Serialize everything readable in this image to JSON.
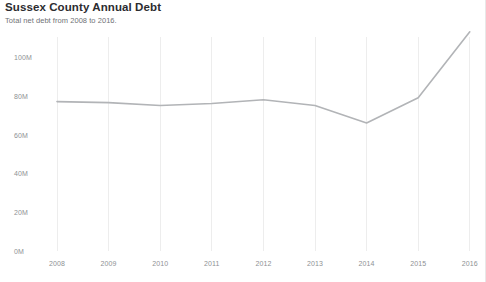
{
  "header": {
    "title": "Sussex County Annual Debt",
    "subtitle": "Total net debt from 2008 to 2016."
  },
  "chart_data": {
    "type": "line",
    "title": "Sussex County Annual Debt",
    "subtitle": "Total net debt from 2008 to 2016.",
    "xlabel": "",
    "ylabel": "",
    "categories": [
      "2008",
      "2009",
      "2010",
      "2011",
      "2012",
      "2013",
      "2014",
      "2015",
      "2016"
    ],
    "values": [
      77000000,
      76500000,
      75000000,
      76000000,
      78000000,
      75000000,
      66000000,
      79000000,
      113000000
    ],
    "y_tick_labels": [
      "0M",
      "20M",
      "40M",
      "60M",
      "80M",
      "100M"
    ],
    "y_tick_values": [
      0,
      20000000,
      40000000,
      60000000,
      80000000,
      100000000
    ],
    "ylim": [
      0,
      100000000
    ],
    "x_tick_labels": [
      "2008",
      "2009",
      "2010",
      "2011",
      "2012",
      "2013",
      "2014",
      "2015",
      "2016"
    ],
    "grid": "vertical",
    "legend": "none",
    "line_color": "#b2b4b7",
    "grid_color": "#ededed",
    "tick_label_color": "#8e9194",
    "title_color": "#2c2c30",
    "subtitle_color": "#6f7276",
    "background_color": "#ffffff"
  },
  "axis": {
    "y_ticks": [
      {
        "label": "100M",
        "y": 57
      },
      {
        "label": "80M",
        "y": 96.6
      },
      {
        "label": "60M",
        "y": 135.2
      },
      {
        "label": "40M",
        "y": 173.8
      },
      {
        "label": "20M",
        "y": 212.4
      },
      {
        "label": "0M",
        "y": 251
      }
    ],
    "x_ticks": [
      {
        "label": "2008",
        "x": 57
      },
      {
        "label": "2009",
        "x": 108.6
      },
      {
        "label": "2010",
        "x": 160.2
      },
      {
        "label": "2011",
        "x": 211.8
      },
      {
        "label": "2012",
        "x": 263.4
      },
      {
        "label": "2013",
        "x": 315
      },
      {
        "label": "2014",
        "x": 366.6
      },
      {
        "label": "2015",
        "x": 418.2
      },
      {
        "label": "2016",
        "x": 469.8
      }
    ]
  }
}
